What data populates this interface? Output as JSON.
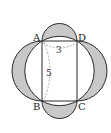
{
  "diagram": {
    "type": "geometry",
    "vertices": {
      "A": "A",
      "B": "B",
      "C": "C",
      "D": "D"
    },
    "measurements": {
      "AD": "3",
      "AB": "5"
    },
    "colors": {
      "shade": "#c8c8c8",
      "stroke": "#2a2a2a",
      "dashed": "#888888"
    }
  }
}
